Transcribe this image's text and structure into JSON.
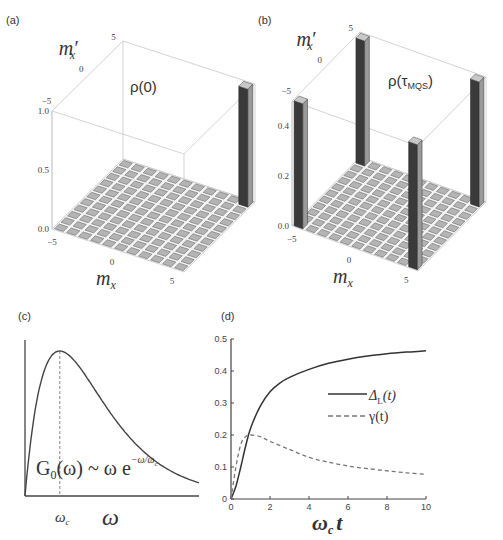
{
  "figure": {
    "panels": [
      {
        "label": "(a)"
      },
      {
        "label": "(b)"
      },
      {
        "label": "(c)"
      },
      {
        "label": "(d)"
      }
    ]
  },
  "chart_data": [
    {
      "panel": "(a)",
      "type": "bar3d",
      "title": "ρ(0)",
      "xlabel": "m_x",
      "ylabel": "m'_x",
      "x_ticks": [
        "-5",
        "0",
        "5"
      ],
      "y_ticks": [
        "-5",
        "0",
        "5"
      ],
      "z_ticks": [
        "0.0",
        "0.5",
        "1.0"
      ],
      "zlim": [
        0,
        1.0
      ],
      "grid_range": [
        -5,
        5
      ],
      "bars": [
        {
          "m_x": 5,
          "m_x_prime": 5,
          "value": 1.0
        }
      ],
      "other_values": 0
    },
    {
      "panel": "(b)",
      "type": "bar3d",
      "title": "ρ(τ_MQS)",
      "title_main": "ρ(τ",
      "title_sub": "MQS",
      "title_end": ")",
      "xlabel": "m_x",
      "ylabel": "m'_x",
      "x_ticks": [
        "-5",
        "0",
        "5"
      ],
      "y_ticks": [
        "-5",
        "0",
        "5"
      ],
      "z_ticks": [
        "0.0",
        "0.2",
        "0.4"
      ],
      "zlim": [
        0,
        0.5
      ],
      "grid_range": [
        -5,
        5
      ],
      "bars": [
        {
          "m_x": -5,
          "m_x_prime": -5,
          "value": 0.5
        },
        {
          "m_x": -5,
          "m_x_prime": 5,
          "value": 0.5
        },
        {
          "m_x": 5,
          "m_x_prime": -5,
          "value": 0.5
        },
        {
          "m_x": 5,
          "m_x_prime": 5,
          "value": 0.5
        }
      ],
      "other_values": 0
    },
    {
      "panel": "(c)",
      "type": "line",
      "title": "",
      "annotation": "G0(ω) ~ ω e^(-ω/ωc)",
      "annotation_main": "G",
      "annotation_sub": "0",
      "annotation_mid": "(ω) ~ ω e",
      "annotation_sup": "−ω/ω",
      "annotation_sup_sub": "c",
      "xlabel": "ω",
      "x_tick_label": "ωc",
      "x_tick_main": "ω",
      "x_tick_sub": "c",
      "x": [
        0,
        0.1,
        0.2,
        0.3,
        0.5,
        0.75,
        1,
        1.25,
        1.5,
        2,
        2.5,
        3,
        3.5,
        4,
        4.5,
        5
      ],
      "values": [
        0,
        0.0905,
        0.1637,
        0.2222,
        0.3033,
        0.3543,
        0.3679,
        0.3581,
        0.3347,
        0.2707,
        0.2052,
        0.1494,
        0.1057,
        0.0733,
        0.05,
        0.0337
      ],
      "marker_x": 1,
      "ticks_shown": false
    },
    {
      "panel": "(d)",
      "type": "line",
      "title": "",
      "xlabel": "ωc t",
      "xlabel_main": "ω",
      "xlabel_sub": "c",
      "xlabel_end": "t",
      "ylabel": "",
      "xlim": [
        0,
        10
      ],
      "ylim": [
        0,
        0.5
      ],
      "x_ticks": [
        "0",
        "2",
        "4",
        "6",
        "8",
        "10"
      ],
      "y_ticks": [
        "0",
        "0.1",
        "0.2",
        "0.3",
        "0.4",
        "0.5"
      ],
      "legend_position": "right-middle",
      "series": [
        {
          "name": "Δ_L(t)",
          "legend_main": "Δ",
          "legend_sub": "L",
          "legend_end": "(t)",
          "style": "solid",
          "color": "#333333",
          "x": [
            0,
            0.25,
            0.5,
            0.75,
            1,
            1.5,
            2,
            2.5,
            3,
            4,
            5,
            6,
            7,
            8,
            9,
            10
          ],
          "values": [
            0,
            0.04,
            0.1,
            0.165,
            0.22,
            0.29,
            0.335,
            0.362,
            0.38,
            0.405,
            0.424,
            0.437,
            0.447,
            0.454,
            0.459,
            0.463
          ]
        },
        {
          "name": "γ(t)",
          "legend_label": "γ(t)",
          "style": "dashed",
          "color": "#777777",
          "x": [
            0,
            0.25,
            0.5,
            0.75,
            1,
            1.5,
            2,
            3,
            4,
            5,
            6,
            7,
            8,
            9,
            10
          ],
          "values": [
            0,
            0.1,
            0.17,
            0.195,
            0.2,
            0.195,
            0.18,
            0.155,
            0.13,
            0.115,
            0.103,
            0.095,
            0.088,
            0.082,
            0.077
          ]
        }
      ]
    }
  ]
}
